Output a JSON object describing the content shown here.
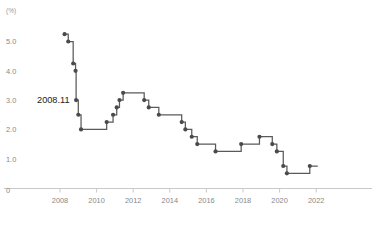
{
  "chart_data": {
    "type": "line",
    "title": "",
    "subtitle": "",
    "xlabel": "",
    "ylabel": "",
    "unit_label": "(%)",
    "grid": false,
    "legend": "none",
    "step_style": "post",
    "xlim": [
      2007.6,
      2023.2
    ],
    "ylim": [
      0,
      5.8
    ],
    "yticks": [
      1.0,
      2.0,
      3.0,
      4.0,
      5.0
    ],
    "ytick_labels": [
      "1.0",
      "2.0",
      "3.0",
      "4.0",
      "5.0"
    ],
    "zero_label": "0",
    "xticks": [
      2008,
      2010,
      2012,
      2014,
      2016,
      2018,
      2020,
      2022
    ],
    "xtick_labels": [
      "2008",
      "2010",
      "2012",
      "2014",
      "2016",
      "2018",
      "2020",
      "2022"
    ],
    "annotations": [
      {
        "text": "2008.11",
        "x": 2008.85,
        "y": 3.0
      }
    ],
    "series": [
      {
        "name": "policy-rate",
        "color": "#5a5a5a",
        "marker_color": "#4a4a4a",
        "points": [
          {
            "x": 2008.25,
            "y": 5.25
          },
          {
            "x": 2008.45,
            "y": 5.0
          },
          {
            "x": 2008.72,
            "y": 4.25
          },
          {
            "x": 2008.85,
            "y": 4.0
          },
          {
            "x": 2008.88,
            "y": 3.0
          },
          {
            "x": 2009.0,
            "y": 2.5
          },
          {
            "x": 2009.15,
            "y": 2.0
          },
          {
            "x": 2010.55,
            "y": 2.25
          },
          {
            "x": 2010.9,
            "y": 2.5
          },
          {
            "x": 2011.1,
            "y": 2.75
          },
          {
            "x": 2011.25,
            "y": 3.0
          },
          {
            "x": 2011.45,
            "y": 3.25
          },
          {
            "x": 2012.6,
            "y": 3.0
          },
          {
            "x": 2012.85,
            "y": 2.75
          },
          {
            "x": 2013.4,
            "y": 2.5
          },
          {
            "x": 2014.65,
            "y": 2.25
          },
          {
            "x": 2014.85,
            "y": 2.0
          },
          {
            "x": 2015.2,
            "y": 1.75
          },
          {
            "x": 2015.5,
            "y": 1.5
          },
          {
            "x": 2016.5,
            "y": 1.25
          },
          {
            "x": 2017.9,
            "y": 1.5
          },
          {
            "x": 2018.9,
            "y": 1.75
          },
          {
            "x": 2019.6,
            "y": 1.5
          },
          {
            "x": 2019.85,
            "y": 1.25
          },
          {
            "x": 2020.2,
            "y": 0.75
          },
          {
            "x": 2020.4,
            "y": 0.5
          },
          {
            "x": 2021.65,
            "y": 0.75
          }
        ]
      }
    ]
  }
}
